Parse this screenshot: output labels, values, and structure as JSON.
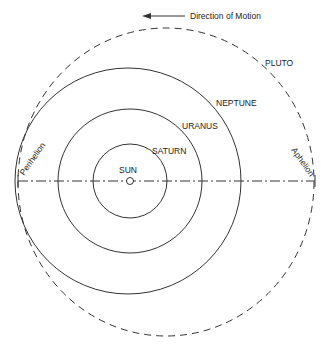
{
  "diagram": {
    "direction_label": "Direction of Motion",
    "labels": {
      "sun": "SUN",
      "saturn": "SATURN",
      "uranus": "URANUS",
      "neptune": "NEPTUNE",
      "pluto": "PLUTO",
      "perihelion": "Perihelion",
      "aphelion": "Aphelion"
    },
    "colors": {
      "line": "#333333",
      "background": "#ffffff"
    }
  }
}
